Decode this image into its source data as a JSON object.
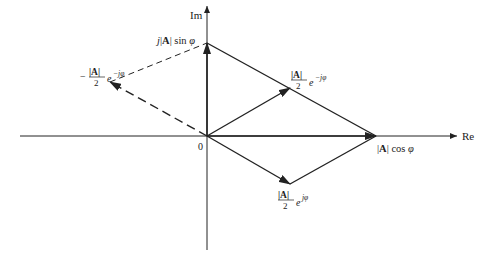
{
  "diagram": {
    "axes": {
      "real_label": "Re",
      "imag_label": "Im",
      "origin_label": "0"
    },
    "points": {
      "top": {
        "pre": "j",
        "bar1": "|",
        "A": "A",
        "bar2": "|",
        "fn": " sin ",
        "phi": "φ"
      },
      "right": {
        "bar1": "|",
        "A": "A",
        "bar2": "|",
        "fn": " cos ",
        "phi": "φ"
      },
      "upper_right": {
        "num": "|A|",
        "den": "2",
        "exp_base": "e",
        "exp": "−jφ"
      },
      "lower": {
        "num": "|A|",
        "den": "2",
        "exp_base": "e",
        "exp": "jφ"
      },
      "left": {
        "sign": "−",
        "num": "|A|",
        "den": "2",
        "exp_base": "e",
        "exp": "−jφ"
      }
    },
    "colors": {
      "line": "#222222",
      "background": "#ffffff"
    }
  }
}
